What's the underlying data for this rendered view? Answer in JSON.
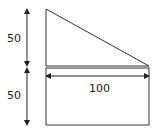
{
  "diagram": {
    "labels": {
      "upper_height": "50",
      "lower_height": "50",
      "width": "100"
    },
    "shapes": [
      "right-triangle",
      "rectangle"
    ],
    "stroke_color": "#333333"
  }
}
